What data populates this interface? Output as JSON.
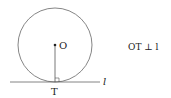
{
  "diagram": {
    "center_label": "O",
    "tangent_point_label": "T",
    "line_label": "l",
    "relation": "OT ⊥ l",
    "stroke_color": "#555555"
  }
}
